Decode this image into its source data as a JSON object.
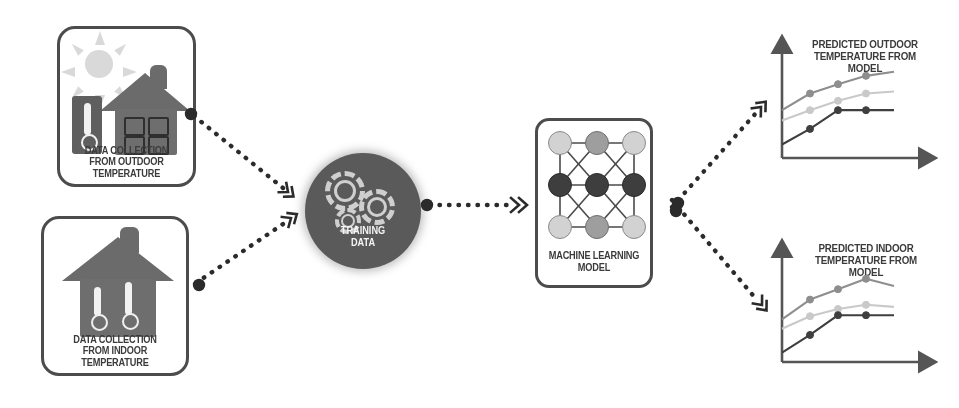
{
  "diagram": {
    "background_color": "#ffffff"
  },
  "palette": {
    "border": "#4c4c4c",
    "text": "#3b3b3b",
    "house_gray": "#6e6e6e",
    "sun_gray": "#d9d9d9",
    "hub_fill": "#5a5a5a",
    "hub_text": "#f4f4f4",
    "gear_gray": "#cfcfcf",
    "node_light": "#d2d2d2",
    "node_mid": "#9e9e9e",
    "node_dark": "#3e3e3e",
    "axis": "#555555",
    "series_dark": "#3f3f3f",
    "series_mid": "#8e8e8e",
    "series_light": "#c9c9c9",
    "connector": "#2b2b2b"
  },
  "sources": [
    {
      "id": "outdoor-source",
      "caption_line1": "DATA COLLECTION",
      "caption_line2": "FROM OUTDOOR TEMPERATURE",
      "icons": [
        "sun-icon",
        "thermometer-icon",
        "house-icon",
        "window-icon"
      ]
    },
    {
      "id": "indoor-source",
      "caption_line1": "DATA COLLECTION",
      "caption_line2": "FROM INDOOR TEMPERATURE",
      "icons": [
        "house-icon",
        "thermometer-icon",
        "thermometer-icon"
      ]
    }
  ],
  "hub": {
    "id": "training-data-hub",
    "caption_line1": "TRAINING",
    "caption_line2": "DATA",
    "icons": [
      "gear-icon",
      "gear-icon",
      "gear-icon"
    ]
  },
  "model": {
    "id": "machine-learning-model",
    "caption_line1": "MACHINE LEARNING",
    "caption_line2": "MODEL",
    "icons": [
      "neural-network-icon"
    ],
    "network": {
      "rows": 3,
      "cols": 3,
      "node_shades": [
        [
          "light",
          "mid",
          "light"
        ],
        [
          "dark",
          "dark",
          "dark"
        ],
        [
          "light",
          "mid",
          "light"
        ]
      ]
    }
  },
  "connectors": [
    {
      "id": "outdoor-to-hub",
      "from": "outdoor-source",
      "to": "training-data-hub",
      "style": "dotted",
      "arrow": "double-chevron"
    },
    {
      "id": "indoor-to-hub",
      "from": "indoor-source",
      "to": "training-data-hub",
      "style": "dotted",
      "arrow": "double-chevron"
    },
    {
      "id": "hub-to-model",
      "from": "training-data-hub",
      "to": "machine-learning-model",
      "style": "dotted",
      "arrow": "double-chevron"
    },
    {
      "id": "model-to-outdoor-chart",
      "from": "machine-learning-model",
      "to": "outdoor-chart",
      "style": "dotted",
      "arrow": "double-chevron"
    },
    {
      "id": "model-to-indoor-chart",
      "from": "machine-learning-model",
      "to": "indoor-chart",
      "style": "dotted",
      "arrow": "double-chevron"
    }
  ],
  "chart_data": [
    {
      "id": "outdoor-chart",
      "type": "line",
      "title": "PREDICTED OUTDOOR TEMPERATURE FROM MODEL",
      "title_line1": "PREDICTED OUTDOOR",
      "title_line2": "TEMPERATURE FROM MODEL",
      "xlabel": "",
      "ylabel": "",
      "xlim": [
        0,
        5
      ],
      "ylim": [
        0,
        10
      ],
      "grid": false,
      "legend": "none",
      "axis_arrows": true,
      "x": [
        0,
        1,
        2,
        3,
        4
      ],
      "series": [
        {
          "name": "upper",
          "color": "#8e8e8e",
          "values": [
            4.6,
            6.2,
            7.1,
            7.9,
            8.3
          ],
          "markers": [
            false,
            true,
            true,
            true,
            false
          ]
        },
        {
          "name": "middle",
          "color": "#c9c9c9",
          "values": [
            3.6,
            4.6,
            5.5,
            6.2,
            6.4
          ],
          "markers": [
            false,
            true,
            true,
            true,
            false
          ]
        },
        {
          "name": "lower",
          "color": "#3f3f3f",
          "values": [
            1.3,
            2.8,
            4.6,
            4.6,
            4.6
          ],
          "markers": [
            false,
            true,
            true,
            true,
            false
          ]
        }
      ]
    },
    {
      "id": "indoor-chart",
      "type": "line",
      "title": "PREDICTED INDOOR TEMPERATURE FROM MODEL",
      "title_line1": "PREDICTED INDOOR",
      "title_line2": "TEMPERATURE FROM MODEL",
      "xlabel": "",
      "ylabel": "",
      "xlim": [
        0,
        5
      ],
      "ylim": [
        0,
        10
      ],
      "grid": false,
      "legend": "none",
      "axis_arrows": true,
      "x": [
        0,
        1,
        2,
        3,
        4
      ],
      "series": [
        {
          "name": "upper",
          "color": "#8e8e8e",
          "values": [
            4.1,
            6.0,
            7.0,
            8.0,
            7.3
          ],
          "markers": [
            false,
            true,
            true,
            true,
            false
          ]
        },
        {
          "name": "middle",
          "color": "#c9c9c9",
          "values": [
            3.2,
            4.4,
            5.1,
            5.5,
            5.3
          ],
          "markers": [
            false,
            true,
            true,
            true,
            false
          ]
        },
        {
          "name": "lower",
          "color": "#3f3f3f",
          "values": [
            0.9,
            2.6,
            4.5,
            4.5,
            4.5
          ],
          "markers": [
            false,
            true,
            true,
            true,
            false
          ]
        }
      ]
    }
  ]
}
